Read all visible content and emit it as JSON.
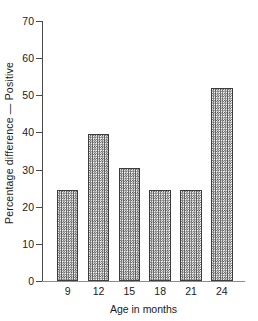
{
  "chart_data": {
    "type": "bar",
    "title": "",
    "xlabel": "Age in months",
    "ylabel": "Percentage difference — Positive",
    "categories": [
      "9",
      "12",
      "15",
      "18",
      "21",
      "24"
    ],
    "values": [
      24.5,
      39.5,
      30.3,
      24.5,
      24.5,
      52.0
    ],
    "ylim": [
      0,
      70
    ],
    "yticks": [
      0,
      10,
      20,
      30,
      40,
      50,
      60,
      70
    ],
    "ytick_labels": [
      "0",
      "10",
      "20",
      "30",
      "40",
      "50",
      "60",
      "70"
    ],
    "grid": false,
    "legend": null,
    "series": [
      {
        "name": "Percentage difference — Positive",
        "values": [
          24.5,
          39.5,
          30.3,
          24.5,
          24.5,
          52.0
        ]
      }
    ],
    "style": {
      "bar_fill": "#9a9a9a",
      "bar_edge": "#3c3c3c",
      "axis_color": "#4a4a4a",
      "background": "#ffffff",
      "fill_pattern": "checkerboard-stipple",
      "frame": "open-left-bottom"
    }
  }
}
